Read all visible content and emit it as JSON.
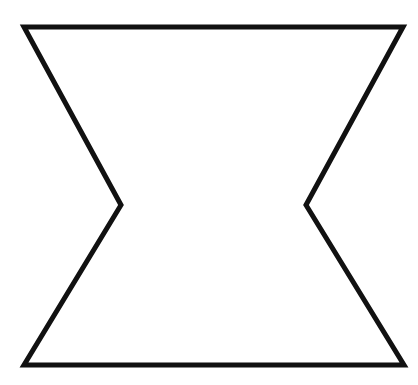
{
  "figure": {
    "name": "concave-octagon-outline",
    "canvas": {
      "width": 418,
      "height": 385,
      "background_color": "#ffffff"
    },
    "stroke": {
      "color": "#111111",
      "width": 5,
      "linejoin": "miter",
      "linecap": "butt"
    },
    "fill_color": "none",
    "vertices": [
      {
        "label": "top-left",
        "x": 24,
        "y": 27
      },
      {
        "label": "top-right",
        "x": 403,
        "y": 27
      },
      {
        "label": "right-notch-tip",
        "x": 306,
        "y": 205
      },
      {
        "label": "bottom-right",
        "x": 404,
        "y": 365
      },
      {
        "label": "bottom-left",
        "x": 24,
        "y": 365
      },
      {
        "label": "left-notch-tip",
        "x": 121,
        "y": 205
      }
    ],
    "path": "M 24 27 L 403 27 L 306 205 L 404 365 L 24 365 L 121 205 Z",
    "edges": [
      {
        "label": "top-edge",
        "from": "top-left",
        "to": "top-right"
      },
      {
        "label": "upper-right-diagonal",
        "from": "top-right",
        "to": "right-notch-tip"
      },
      {
        "label": "lower-right-diagonal",
        "from": "right-notch-tip",
        "to": "bottom-right"
      },
      {
        "label": "bottom-edge",
        "from": "bottom-right",
        "to": "bottom-left"
      },
      {
        "label": "lower-left-diagonal",
        "from": "bottom-left",
        "to": "left-notch-tip"
      },
      {
        "label": "upper-left-diagonal",
        "from": "left-notch-tip",
        "to": "top-left"
      }
    ]
  }
}
